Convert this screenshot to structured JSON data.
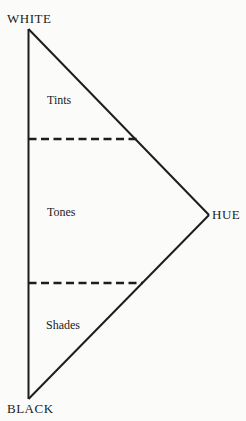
{
  "diagram": {
    "vertex_labels": {
      "top": "WHITE",
      "right": "HUE",
      "bottom": "BLACK"
    },
    "region_labels": {
      "upper": "Tints",
      "middle": "Tones",
      "lower": "Shades"
    }
  },
  "colors": {
    "line": "#1d1d1d",
    "text": "#1c1c1c",
    "background": "#fbfbfa"
  }
}
